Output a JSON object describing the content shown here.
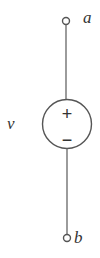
{
  "diagram": {
    "type": "circuit-element",
    "element": "independent voltage source",
    "source_label": "v",
    "polarity": {
      "top": "+",
      "bottom": "−"
    },
    "terminals": [
      {
        "name": "a",
        "position": "top"
      },
      {
        "name": "b",
        "position": "bottom"
      }
    ],
    "colors": {
      "stroke": "#555555",
      "text": "#333333",
      "background": "#ffffff"
    }
  }
}
